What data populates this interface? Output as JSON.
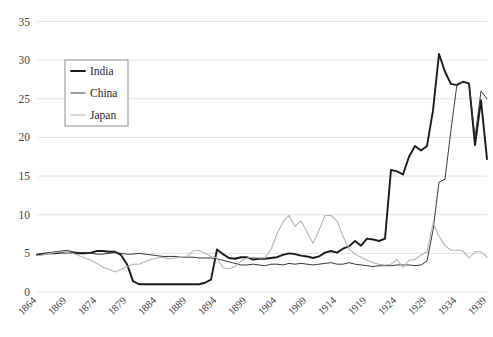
{
  "chart_data": {
    "type": "line",
    "title": "",
    "subtitle": "",
    "xlabel": "",
    "ylabel": "",
    "xlim": [
      1864,
      1939
    ],
    "ylim": [
      0,
      35
    ],
    "grid": true,
    "grid_axis": "y",
    "legend_position": "upper-left-inside",
    "y_ticks": [
      0,
      5,
      10,
      15,
      20,
      25,
      30,
      35
    ],
    "y_tick_labels": [
      "0",
      "5",
      "10",
      "15",
      "20",
      "25",
      "30",
      "35"
    ],
    "x_ticks": [
      1864,
      1869,
      1874,
      1879,
      1884,
      1889,
      1894,
      1899,
      1904,
      1909,
      1914,
      1919,
      1924,
      1929,
      1934,
      1939
    ],
    "x_tick_labels": [
      "1864",
      "1869",
      "1874",
      "1879",
      "1884",
      "1889",
      "1894",
      "1899",
      "1904",
      "1909",
      "1914",
      "1919",
      "1924",
      "1929",
      "1934",
      "1939"
    ],
    "x_tick_rotation": -45,
    "x": [
      1864,
      1865,
      1866,
      1867,
      1868,
      1869,
      1870,
      1871,
      1872,
      1873,
      1874,
      1875,
      1876,
      1877,
      1878,
      1879,
      1880,
      1881,
      1882,
      1883,
      1884,
      1885,
      1886,
      1887,
      1888,
      1889,
      1890,
      1891,
      1892,
      1893,
      1894,
      1895,
      1896,
      1897,
      1898,
      1899,
      1900,
      1901,
      1902,
      1903,
      1904,
      1905,
      1906,
      1907,
      1908,
      1909,
      1910,
      1911,
      1912,
      1913,
      1914,
      1915,
      1916,
      1917,
      1918,
      1919,
      1920,
      1921,
      1922,
      1923,
      1924,
      1925,
      1926,
      1927,
      1928,
      1929,
      1930,
      1931,
      1932,
      1933,
      1934,
      1935,
      1936,
      1937,
      1938,
      1939
    ],
    "series": [
      {
        "name": "India",
        "color": "#1a1a1a",
        "line_width": 1.9,
        "values": [
          4.8,
          4.9,
          5.0,
          5.0,
          5.1,
          5.1,
          5.1,
          5.0,
          5.0,
          5.1,
          5.3,
          5.3,
          5.2,
          5.2,
          4.8,
          3.6,
          1.4,
          1.0,
          1.0,
          1.0,
          1.0,
          1.0,
          1.0,
          1.0,
          1.0,
          1.0,
          1.0,
          1.0,
          1.2,
          1.6,
          5.5,
          4.9,
          4.4,
          4.3,
          4.5,
          4.5,
          4.2,
          4.3,
          4.3,
          4.4,
          4.5,
          4.8,
          5.0,
          4.9,
          4.7,
          4.6,
          4.4,
          4.6,
          5.1,
          5.3,
          5.1,
          5.6,
          5.9,
          6.6,
          6.0,
          6.9,
          6.8,
          6.6,
          6.9,
          15.8,
          15.6,
          15.2,
          17.5,
          18.9,
          18.3,
          18.9,
          23.5,
          30.8,
          28.5,
          26.9,
          26.8,
          27.2,
          27.0,
          19.0,
          24.8,
          17.2
        ]
      },
      {
        "name": "China",
        "color": "#2e2e2e",
        "line_width": 0.95,
        "values": [
          4.9,
          5.0,
          5.1,
          5.2,
          5.3,
          5.4,
          5.2,
          5.1,
          5.1,
          5.0,
          4.9,
          4.9,
          5.0,
          5.1,
          5.0,
          4.9,
          4.9,
          5.0,
          4.9,
          4.8,
          4.7,
          4.6,
          4.6,
          4.6,
          4.5,
          4.5,
          4.5,
          4.4,
          4.4,
          4.4,
          4.3,
          4.1,
          3.9,
          3.7,
          3.5,
          3.5,
          3.6,
          3.5,
          3.4,
          3.6,
          3.6,
          3.5,
          3.7,
          3.6,
          3.7,
          3.6,
          3.5,
          3.6,
          3.7,
          3.8,
          3.6,
          3.6,
          3.8,
          3.6,
          3.5,
          3.4,
          3.3,
          3.4,
          3.4,
          3.4,
          3.5,
          3.5,
          3.5,
          3.4,
          3.5,
          4.0,
          8.0,
          14.2,
          14.6,
          21.0,
          26.9,
          27.2,
          27.0,
          20.0,
          26.0,
          25.0
        ]
      },
      {
        "name": "Japan",
        "color": "#b3b3b3",
        "line_width": 1.1,
        "values": [
          4.7,
          4.8,
          5.0,
          5.1,
          5.2,
          5.1,
          5.0,
          4.7,
          4.4,
          4.1,
          3.7,
          3.2,
          2.9,
          2.6,
          2.9,
          3.3,
          3.6,
          3.6,
          3.9,
          4.2,
          4.4,
          4.5,
          4.3,
          4.4,
          4.5,
          4.6,
          5.3,
          5.4,
          5.0,
          4.6,
          4.4,
          3.1,
          3.0,
          3.3,
          4.0,
          4.4,
          4.5,
          4.4,
          4.4,
          5.5,
          7.5,
          9.1,
          9.9,
          8.5,
          9.2,
          7.8,
          6.3,
          8.0,
          9.9,
          9.9,
          9.2,
          7.2,
          5.6,
          4.9,
          4.5,
          4.1,
          3.8,
          3.6,
          3.5,
          3.6,
          4.2,
          3.2,
          4.1,
          4.2,
          4.8,
          5.2,
          8.9,
          7.2,
          6.0,
          5.4,
          5.4,
          5.3,
          4.4,
          5.2,
          5.2,
          4.5
        ]
      }
    ]
  },
  "legend": {
    "entries": [
      {
        "label": "India"
      },
      {
        "label": "China"
      },
      {
        "label": "Japan"
      }
    ]
  },
  "colors": {
    "india": "#1a1a1a",
    "china": "#2e2e2e",
    "japan": "#b3b3b3",
    "gridline": "#d9d9d9",
    "axis_text": "#3f3f3f",
    "background": "#ffffff"
  }
}
